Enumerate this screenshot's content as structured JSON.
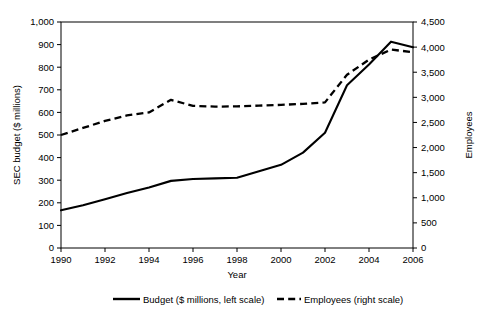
{
  "chart_data": {
    "type": "line",
    "title": "",
    "xlabel": "Year",
    "ylabel": "SEC budget ($ millions)",
    "y2label": "Employees",
    "grid": false,
    "legend_position": "bottom",
    "x": [
      1990,
      1991,
      1992,
      1993,
      1994,
      1995,
      1996,
      1997,
      1998,
      1999,
      2000,
      2001,
      2002,
      2003,
      2004,
      2005,
      2006
    ],
    "xlim": [
      1990,
      2006
    ],
    "xticks": [
      1990,
      1992,
      1994,
      1996,
      1998,
      2000,
      2002,
      2004,
      2006
    ],
    "xtick_labels": [
      "1990",
      "1992",
      "1994",
      "1996",
      "1998",
      "2000",
      "2002",
      "2004",
      "2006"
    ],
    "ylim": [
      0,
      1000
    ],
    "yticks": [
      0,
      100,
      200,
      300,
      400,
      500,
      600,
      700,
      800,
      900,
      1000
    ],
    "ytick_labels": [
      "0",
      "100",
      "200",
      "300",
      "400",
      "500",
      "600",
      "700",
      "800",
      "900",
      "1,000"
    ],
    "y2lim": [
      0,
      4500
    ],
    "y2ticks": [
      0,
      500,
      1000,
      1500,
      2000,
      2500,
      3000,
      3500,
      4000,
      4500
    ],
    "y2tick_labels": [
      "0",
      "500",
      "1,000",
      "1,500",
      "2,000",
      "2,500",
      "3,000",
      "3,500",
      "4,000",
      "4,500"
    ],
    "series": [
      {
        "name": "Budget ($ millions, left scale)",
        "axis": "left",
        "style": "solid",
        "color": "#000000",
        "values": [
          167,
          189,
          216,
          243,
          268,
          297,
          305,
          308,
          311,
          340,
          368,
          422,
          510,
          720,
          812,
          913,
          888
        ]
      },
      {
        "name": "Employees (right scale)",
        "axis": "right",
        "style": "dashed",
        "color": "#000000",
        "values": [
          2250,
          2390,
          2530,
          2640,
          2700,
          2950,
          2830,
          2815,
          2820,
          2835,
          2850,
          2870,
          2900,
          3450,
          3750,
          3950,
          3900
        ]
      }
    ]
  },
  "legend": {
    "items": [
      {
        "label": "Budget ($ millions, left scale)",
        "style": "solid"
      },
      {
        "label": "Employees (right scale)",
        "style": "dashed"
      }
    ]
  }
}
